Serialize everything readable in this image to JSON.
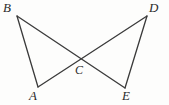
{
  "figure": {
    "type": "geometry-diagram",
    "canvas": {
      "width": 169,
      "height": 105
    },
    "style": {
      "background_color": "#fdfdfc",
      "stroke_color": "#3a3a3a",
      "label_color": "#2b2b2b",
      "stroke_width": 1.3
    },
    "points": [
      {
        "id": "B",
        "label": "B",
        "x": 17,
        "y": 16,
        "label_x": 3,
        "label_y": 1
      },
      {
        "id": "D",
        "label": "D",
        "x": 147,
        "y": 16,
        "label_x": 149,
        "label_y": 1
      },
      {
        "id": "A",
        "label": "A",
        "x": 38,
        "y": 87,
        "label_x": 29,
        "label_y": 89
      },
      {
        "id": "E",
        "label": "E",
        "x": 125,
        "y": 88,
        "label_x": 122,
        "label_y": 89
      },
      {
        "id": "C",
        "label": "C",
        "x": 82,
        "y": 60,
        "label_x": 75,
        "label_y": 64
      }
    ],
    "segments": [
      {
        "id": "BA",
        "from": "B",
        "to": "A",
        "label": "segment B to A"
      },
      {
        "id": "BE",
        "from": "B",
        "to": "E",
        "label": "segment B to E through C"
      },
      {
        "id": "DA",
        "from": "D",
        "to": "A",
        "label": "segment D to A through C"
      },
      {
        "id": "DE",
        "from": "D",
        "to": "E",
        "label": "segment D to E"
      }
    ]
  }
}
